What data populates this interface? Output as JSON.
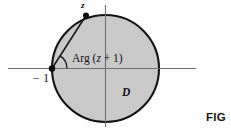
{
  "figure": {
    "caption_fragment": "FIG",
    "background_color": "#fdfdfd",
    "disk_fill_color": "#c9c9c9",
    "disk_stroke_color": "#141414",
    "axis_color": "#6e6e6e",
    "chord_color": "#141414",
    "point_color": "#0a0a0a",
    "labels": {
      "point_z": "z",
      "point_minus_one": "− 1",
      "angle": "Arg (",
      "angle_variable": "z",
      "angle_tail": " + 1)",
      "region": "D"
    },
    "geometry": {
      "center_x": 105.5,
      "center_y": 68.5,
      "radius": 53.5,
      "x_axis_y": 68.5,
      "x_axis_start": 8,
      "x_axis_end": 196,
      "y_axis_x": 105.5,
      "y_axis_start": 5,
      "y_axis_end": 127,
      "point_minus_one_x": 52,
      "point_minus_one_y": 68.5,
      "point_z_x": 86,
      "point_z_y": 15.5,
      "arc_radius": 15
    }
  }
}
